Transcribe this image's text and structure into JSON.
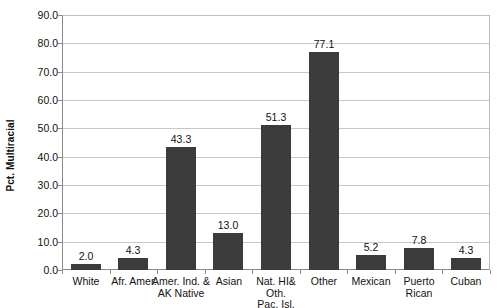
{
  "chart_data": {
    "type": "bar",
    "title": "",
    "subtitle": "",
    "xlabel": "",
    "ylabel": "Pct. Multiracial",
    "ylim": [
      0.0,
      90.0
    ],
    "ytick_step": 10.0,
    "yticks": [
      "0.0",
      "10.0",
      "20.0",
      "30.0",
      "40.0",
      "50.0",
      "60.0",
      "70.0",
      "80.0",
      "90.0"
    ],
    "grid": "horizontal",
    "legend": "none",
    "bar_color": "#3b3b3b",
    "gridline_color": "#c8c8c8",
    "axis_color": "#8a8a8a",
    "categories": [
      "White",
      "Afr. Amer.",
      "Amer. Ind. &\nAK Native",
      "Asian",
      "Nat. HI& Oth.\nPac. Isl.",
      "Other",
      "Mexican",
      "Puerto Rican",
      "Cuban"
    ],
    "values": [
      2.0,
      4.3,
      43.3,
      13.0,
      51.3,
      77.1,
      5.2,
      7.8,
      4.3
    ],
    "value_labels": [
      "2.0",
      "4.3",
      "43.3",
      "13.0",
      "51.3",
      "77.1",
      "5.2",
      "7.8",
      "4.3"
    ]
  }
}
